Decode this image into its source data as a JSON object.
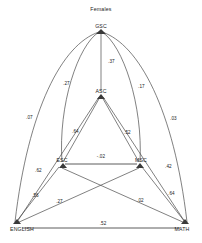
{
  "title": "Females",
  "diagram": {
    "type": "path-diagram",
    "nodes": [
      {
        "id": "GSC",
        "label": "GSC"
      },
      {
        "id": "ASC",
        "label": "ASC"
      },
      {
        "id": "ESC",
        "label": "ESC"
      },
      {
        "id": "MSC",
        "label": "MSC"
      },
      {
        "id": "ENGLISH",
        "label": "ENGLISH"
      },
      {
        "id": "MATH",
        "label": "MATH"
      }
    ],
    "edges": [
      {
        "from": "GSC",
        "to": "ASC",
        "value": ".37"
      },
      {
        "from": "GSC",
        "to": "ESC",
        "value": ".27"
      },
      {
        "from": "GSC",
        "to": "MSC",
        "value": ".17"
      },
      {
        "from": "GSC",
        "to": "ENGLISH",
        "value": ".07"
      },
      {
        "from": "GSC",
        "to": "MATH",
        "value": ".03"
      },
      {
        "from": "ASC",
        "to": "ESC",
        "value": ".64"
      },
      {
        "from": "ASC",
        "to": "MSC",
        "value": ".52"
      },
      {
        "from": "ASC",
        "to": "ENGLISH",
        "value": ".62"
      },
      {
        "from": "ASC",
        "to": "MATH",
        "value": ".42"
      },
      {
        "from": "ESC",
        "to": "MSC",
        "value": "-.02"
      },
      {
        "from": "ESC",
        "to": "ENGLISH",
        "value": ".56"
      },
      {
        "from": "ESC",
        "to": "MATH",
        "value": ".02"
      },
      {
        "from": "MSC",
        "to": "ENGLISH",
        "value": ".27"
      },
      {
        "from": "MSC",
        "to": "MATH",
        "value": ".64"
      },
      {
        "from": "ENGLISH",
        "to": "MATH",
        "value": ".52"
      }
    ]
  }
}
